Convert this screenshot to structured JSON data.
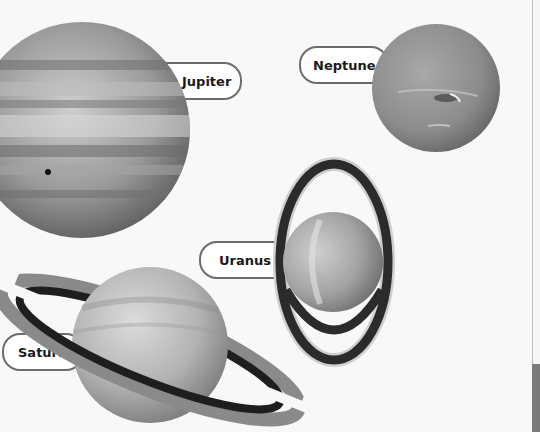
{
  "planets": [
    {
      "name": "Jupiter"
    },
    {
      "name": "Neptune"
    },
    {
      "name": "Uranus"
    },
    {
      "name": "Saturn"
    }
  ]
}
